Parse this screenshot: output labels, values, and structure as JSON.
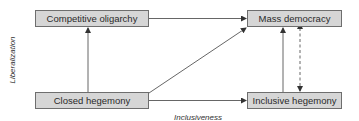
{
  "diagram": {
    "nodes": {
      "competitive_oligarchy": "Competitive oligarchy",
      "mass_democracy": "Mass democracy",
      "closed_hegemony": "Closed hegemony",
      "inclusive_hegemony": "Inclusive hegemony"
    },
    "axes": {
      "y_label": "Liberalization",
      "x_label": "Inclusiveness"
    },
    "edges": [
      {
        "from": "competitive_oligarchy",
        "to": "mass_democracy",
        "style": "solid"
      },
      {
        "from": "closed_hegemony",
        "to": "competitive_oligarchy",
        "style": "solid"
      },
      {
        "from": "closed_hegemony",
        "to": "mass_democracy",
        "style": "solid"
      },
      {
        "from": "closed_hegemony",
        "to": "inclusive_hegemony",
        "style": "solid"
      },
      {
        "from": "inclusive_hegemony",
        "to": "mass_democracy",
        "style": "solid"
      },
      {
        "from": "mass_democracy",
        "to": "inclusive_hegemony",
        "style": "dashed",
        "bidirectional": true
      }
    ],
    "colors": {
      "node_fill": "#d6d6d6",
      "node_border": "#6e6e6e",
      "edge": "#444444"
    }
  }
}
